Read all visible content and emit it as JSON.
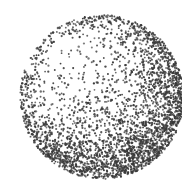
{
  "image": {
    "description": "Stippled pointillist drawing of a sphere",
    "width": 182,
    "height": 191,
    "background": "#ffffff"
  },
  "sphere": {
    "cx": 102,
    "cy": 97,
    "r": 82,
    "dot_color": "#3a3a3a",
    "dot_radius": 0.85,
    "dot_count": 3200,
    "seed": 1337,
    "light": {
      "x": -0.35,
      "y": -0.45,
      "z": 0.82
    },
    "highlight_center": [
      85,
      65
    ],
    "dark_band_y": [
      120,
      160
    ],
    "reflected_light_rim": true
  }
}
